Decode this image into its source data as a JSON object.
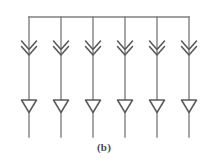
{
  "figure": {
    "caption": "(b)",
    "line_color": "#808080",
    "symbol_color": "#5a5a5a",
    "background_color": "#ffffff",
    "canvas": {
      "width": 208,
      "height": 167
    }
  },
  "bus": {
    "label": "horizontal bus line",
    "x_start": 29,
    "x_end": 189,
    "y": 17
  },
  "branches": [
    {
      "index": 1,
      "x": 29,
      "y_top": 17,
      "y_bottom": 137,
      "chevron": {
        "name": "double-chevron-down",
        "count": 2,
        "y": 47
      },
      "triangle": {
        "name": "nabla-triangle-down",
        "y": 106
      }
    },
    {
      "index": 2,
      "x": 61,
      "y_top": 17,
      "y_bottom": 137,
      "chevron": {
        "name": "double-chevron-down",
        "count": 2,
        "y": 47
      },
      "triangle": {
        "name": "nabla-triangle-down",
        "y": 106
      }
    },
    {
      "index": 3,
      "x": 93,
      "y_top": 17,
      "y_bottom": 137,
      "chevron": {
        "name": "double-chevron-down",
        "count": 2,
        "y": 47
      },
      "triangle": {
        "name": "nabla-triangle-down",
        "y": 106
      }
    },
    {
      "index": 4,
      "x": 125,
      "y_top": 17,
      "y_bottom": 137,
      "chevron": {
        "name": "double-chevron-down",
        "count": 2,
        "y": 47
      },
      "triangle": {
        "name": "nabla-triangle-down",
        "y": 106
      }
    },
    {
      "index": 5,
      "x": 157,
      "y_top": 17,
      "y_bottom": 137,
      "chevron": {
        "name": "double-chevron-down",
        "count": 2,
        "y": 47
      },
      "triangle": {
        "name": "nabla-triangle-down",
        "y": 106
      }
    },
    {
      "index": 6,
      "x": 189,
      "y_top": 17,
      "y_bottom": 137,
      "chevron": {
        "name": "double-chevron-down",
        "count": 2,
        "y": 47
      },
      "triangle": {
        "name": "nabla-triangle-down",
        "y": 106
      }
    }
  ]
}
